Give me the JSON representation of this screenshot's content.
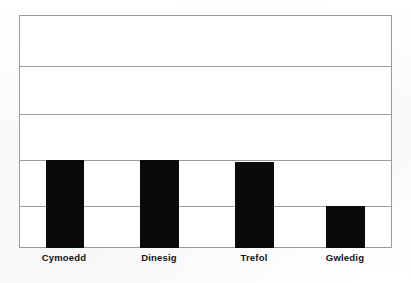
{
  "chart_data": {
    "type": "bar",
    "title": "",
    "subtitle": "",
    "xlabel": "",
    "ylabel": "",
    "categories": [
      "Cymoedd",
      "Dinesig",
      "Trefol",
      "Gwledig"
    ],
    "values": [
      1.91,
      1.91,
      1.87,
      0.92
    ],
    "ylim": [
      0,
      5
    ],
    "yticks": [
      0,
      1,
      2,
      3,
      4,
      5
    ],
    "ytick_labels": [],
    "grid": true,
    "gridlines_count": 4,
    "legend": [],
    "legend_position": "none",
    "annotations": [],
    "series": [
      {
        "name": "",
        "values": [
          1.91,
          1.91,
          1.87,
          0.92
        ]
      }
    ]
  },
  "style": {
    "bar_color": "#0a0a0a",
    "grid_color": "#9e9e9e",
    "frame_color": "#9a9a9a",
    "plot_background": "#ffffff",
    "page_background": "#fdfdfd",
    "label_color": "#141414"
  },
  "geometry": {
    "plot": {
      "left": 19,
      "top": 15,
      "width": 373,
      "height": 233
    },
    "gridlines_y": [
      50,
      98,
      144,
      190
    ],
    "bars": [
      {
        "left": 27,
        "width": 38,
        "top": 144
      },
      {
        "left": 121,
        "width": 39,
        "top": 144
      },
      {
        "left": 216,
        "width": 39,
        "top": 146
      },
      {
        "left": 307,
        "width": 39,
        "top": 190
      }
    ],
    "labels": [
      {
        "center": 45
      },
      {
        "center": 140
      },
      {
        "center": 235
      },
      {
        "center": 326
      }
    ]
  }
}
